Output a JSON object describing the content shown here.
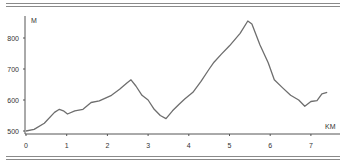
{
  "chart_data": {
    "type": "line",
    "title": "",
    "xlabel": "KM",
    "ylabel": "M",
    "xlim": [
      0,
      7.5
    ],
    "ylim": [
      500,
      870
    ],
    "x_ticks": [
      "0",
      "1",
      "2",
      "3",
      "4",
      "5",
      "6",
      "7"
    ],
    "y_ticks": [
      "500",
      "600",
      "700",
      "800"
    ],
    "grid": false,
    "legend": null,
    "series": [
      {
        "name": "elevation",
        "color": "#6e6e6e",
        "x": [
          0,
          0.2,
          0.45,
          0.7,
          0.82,
          0.92,
          1.02,
          1.2,
          1.4,
          1.6,
          1.8,
          2.1,
          2.3,
          2.48,
          2.58,
          2.7,
          2.85,
          3.0,
          3.15,
          3.3,
          3.44,
          3.6,
          3.75,
          3.9,
          4.1,
          4.3,
          4.5,
          4.62,
          4.8,
          5.0,
          5.26,
          5.45,
          5.55,
          5.75,
          5.95,
          6.1,
          6.3,
          6.5,
          6.7,
          6.85,
          7.0,
          7.15,
          7.27,
          7.4
        ],
        "values": [
          500,
          505,
          525,
          560,
          570,
          565,
          555,
          565,
          570,
          592,
          597,
          615,
          635,
          655,
          665,
          645,
          615,
          600,
          570,
          550,
          540,
          565,
          585,
          603,
          625,
          660,
          700,
          722,
          748,
          775,
          815,
          855,
          845,
          777,
          720,
          665,
          640,
          615,
          600,
          580,
          595,
          598,
          620,
          625
        ]
      }
    ]
  }
}
